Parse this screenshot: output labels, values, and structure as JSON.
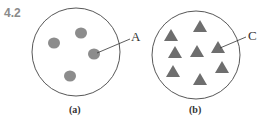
{
  "problem_number": "4.2",
  "panels": [
    {
      "caption": "(a)",
      "callout_label": "A",
      "shape": "circle",
      "particle_count": 4,
      "particle_color": "#8c8c8c"
    },
    {
      "caption": "(b)",
      "callout_label": "C",
      "shape": "triangle",
      "particle_count": 8,
      "particle_color": "#6e6e6e"
    }
  ],
  "colors": {
    "outline": "#444444",
    "text": "#333333",
    "problem_number": "#8a8a8a"
  }
}
